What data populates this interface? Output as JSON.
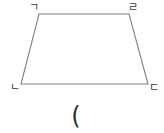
{
  "figure": {
    "type": "trapezoid",
    "background_color": "#ffffff",
    "stroke_color": "#808080",
    "label_color": "#3d3d3d",
    "vertices": {
      "top_left": {
        "label": "ㄱ",
        "x": 39,
        "y": 14
      },
      "top_right": {
        "label": "ㄹ",
        "x": 129,
        "y": 14
      },
      "bottom_right": {
        "label": "ㄷ",
        "x": 148,
        "y": 84
      },
      "bottom_left": {
        "label": "ㄴ",
        "x": 21,
        "y": 84
      }
    },
    "edges": [
      {
        "name": "top-edge",
        "from": "top_left",
        "to": "top_right"
      },
      {
        "name": "right-edge",
        "from": "top_right",
        "to": "bottom_right"
      },
      {
        "name": "bottom-edge",
        "from": "bottom_right",
        "to": "bottom_left"
      },
      {
        "name": "left-edge",
        "from": "bottom_left",
        "to": "top_left"
      }
    ]
  },
  "caption": {
    "symbol": "("
  }
}
